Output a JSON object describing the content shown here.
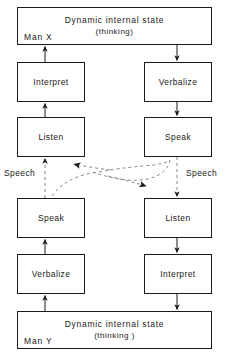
{
  "diagram": {
    "title_top": "Dynamic internal state",
    "subtitle_top": "(thinking)",
    "label_man_x": "Man X",
    "title_bottom": "Dynamic internal state",
    "subtitle_bottom": "(thinking )",
    "label_man_y": "Man Y",
    "left_column": {
      "interpret": "Interpret",
      "listen": "Listen",
      "speak": "Speak",
      "verbalize": "Verbalize"
    },
    "right_column": {
      "verbalize": "Verbalize",
      "speak": "Speak",
      "listen": "Listen",
      "interpret": "Interpret"
    },
    "speech_left": "Speech",
    "speech_right": "Speech",
    "colors": {
      "stroke": "#1a1a1a",
      "dashed": "#7d7d7d",
      "background": "#ffffff"
    }
  }
}
